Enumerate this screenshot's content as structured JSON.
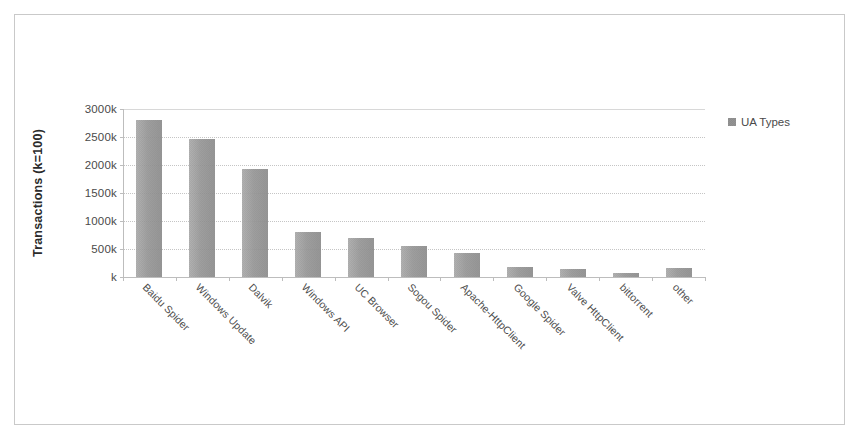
{
  "chart_data": {
    "type": "bar",
    "title": "",
    "xlabel": "",
    "ylabel": "Transactions (k=100)",
    "categories": [
      "Baidu Spider",
      "Windows Update",
      "Dalvik",
      "Windows API",
      "UC Browser",
      "Sogou Spider",
      "Apache-HttpClient",
      "Google Spider",
      "Valve HttpClient",
      "bittorrent",
      "other"
    ],
    "values": [
      2800,
      2470,
      1920,
      800,
      690,
      560,
      420,
      180,
      150,
      80,
      160
    ],
    "value_unit": "k",
    "series": [
      {
        "name": "UA Types",
        "values": [
          2800,
          2470,
          1920,
          800,
          690,
          560,
          420,
          180,
          150,
          80,
          160
        ]
      }
    ],
    "ylim": [
      0,
      3000
    ],
    "ytick_values": [
      0,
      500,
      1000,
      1500,
      2000,
      2500,
      3000
    ],
    "ytick_labels": [
      "k",
      "500k",
      "1000k",
      "1500k",
      "2000k",
      "2500k",
      "3000k"
    ],
    "grid": true,
    "legend": [
      "UA Types"
    ],
    "legend_position": "top-right",
    "colors": {
      "bar_fill": "#b9b9b9",
      "gridline": "#c5c5c5",
      "axis": "#bdbdbd",
      "text": "#4a4a4a",
      "frame": "#c9c9c9",
      "background": "#ffffff"
    }
  },
  "legend": {
    "label": "UA Types",
    "marker": "hatched-square-swatch"
  },
  "axes": {
    "y_title": "Transactions (k=100)"
  }
}
